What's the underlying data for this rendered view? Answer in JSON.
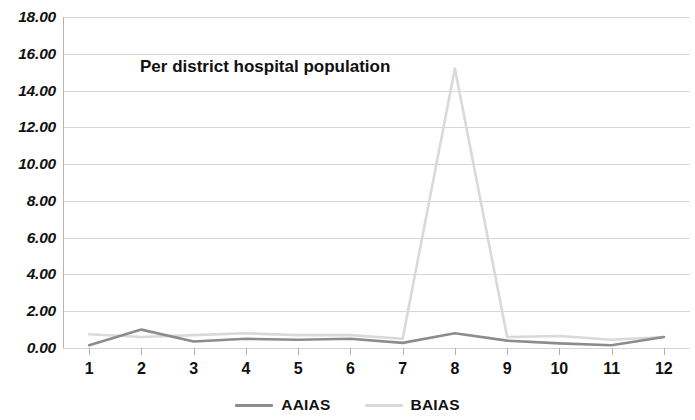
{
  "chart_data": {
    "type": "line",
    "title": "Per district hospital population",
    "xlabel": "",
    "ylabel": "",
    "x": [
      1,
      2,
      3,
      4,
      5,
      6,
      7,
      8,
      9,
      10,
      11,
      12
    ],
    "categories": [
      "1",
      "2",
      "3",
      "4",
      "5",
      "6",
      "7",
      "8",
      "9",
      "10",
      "11",
      "12"
    ],
    "series": [
      {
        "name": "AAIAS",
        "color": "#8c8c8c",
        "values": [
          0.15,
          1.0,
          0.35,
          0.5,
          0.45,
          0.5,
          0.28,
          0.8,
          0.4,
          0.25,
          0.15,
          0.6
        ]
      },
      {
        "name": "BAIAS",
        "color": "#d9d9d9",
        "values": [
          0.75,
          0.6,
          0.7,
          0.8,
          0.7,
          0.7,
          0.5,
          15.2,
          0.6,
          0.65,
          0.45,
          0.6
        ]
      }
    ],
    "ylim": [
      0.0,
      18.0
    ],
    "ytick_step": 2.0,
    "ytick_labels": [
      "0.00",
      "2.00",
      "4.00",
      "6.00",
      "8.00",
      "10.00",
      "12.00",
      "14.00",
      "16.00",
      "18.00"
    ],
    "grid": true,
    "grid_color": "#d6d6d6",
    "legend_position": "bottom",
    "background": "#ffffff"
  },
  "legend": {
    "items": [
      {
        "label": "AAIAS",
        "color": "#8c8c8c"
      },
      {
        "label": "BAIAS",
        "color": "#d9d9d9"
      }
    ]
  }
}
